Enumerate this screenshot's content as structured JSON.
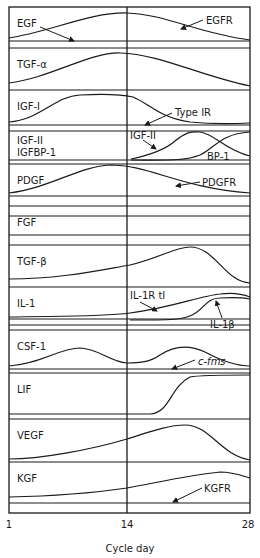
{
  "figure": {
    "box": {
      "x": 9,
      "y": 7,
      "width": 241,
      "height": 506
    },
    "day14_x": 127,
    "line_color": "#1a1a1a",
    "axis": {
      "title": "Cycle day",
      "ticks": [
        {
          "label": "1",
          "x": 9
        },
        {
          "label": "14",
          "x": 127
        },
        {
          "label": "28",
          "x": 248
        }
      ]
    },
    "rows": [
      {
        "id": "egf",
        "label": "EGF",
        "top": 7,
        "bottom": 48,
        "inner_lines": [
          41
        ]
      },
      {
        "id": "tgf-alpha",
        "label": "TGF-α",
        "top": 48,
        "bottom": 90,
        "inner_lines": []
      },
      {
        "id": "igf-i",
        "label": "IGF-I",
        "top": 90,
        "bottom": 131,
        "inner_lines": [
          125
        ]
      },
      {
        "id": "igf-ii",
        "label": "IGF-II",
        "label2": "IGFBP-1",
        "top": 131,
        "bottom": 164,
        "inner_lines": [
          160
        ]
      },
      {
        "id": "pdgf",
        "label": "PDGF",
        "top": 164,
        "bottom": 206,
        "inner_lines": [
          196
        ]
      },
      {
        "id": "fgf",
        "label": "FGF",
        "top": 206,
        "bottom": 245,
        "inner_lines": [
          216,
          235
        ]
      },
      {
        "id": "tgf-beta",
        "label": "TGF-β",
        "top": 245,
        "bottom": 287,
        "inner_lines": []
      },
      {
        "id": "il-1",
        "label": "IL-1",
        "top": 287,
        "bottom": 330,
        "inner_lines": [
          319,
          325
        ]
      },
      {
        "id": "csf-1",
        "label": "CSF-1",
        "top": 330,
        "bottom": 373,
        "inner_lines": [
          369
        ]
      },
      {
        "id": "lif",
        "label": "LIF",
        "top": 373,
        "bottom": 419,
        "inner_lines": []
      },
      {
        "id": "vegf",
        "label": "VEGF",
        "top": 419,
        "bottom": 462,
        "inner_lines": []
      },
      {
        "id": "kgf",
        "label": "KGF",
        "top": 462,
        "bottom": 513,
        "inner_lines": [
          503
        ]
      }
    ],
    "curves": [
      {
        "name": "egf-curve",
        "d": "M9,38 C50,32 90,12 127,13 C165,14 200,34 250,40"
      },
      {
        "name": "tgf-alpha-curve",
        "d": "M9,83 C50,78 90,52 120,53 C160,54 200,76 250,86"
      },
      {
        "name": "igf-i-curve",
        "d": "M9,122 C40,120 55,96 80,95 C100,94 120,94 133,97 C150,104 160,118 190,122 C210,124 230,124 250,123"
      },
      {
        "name": "igf-ii-curve",
        "d": "M131,159 C150,155 165,150 175,141 C185,133 190,131 200,132 C215,134 225,150 250,156"
      },
      {
        "name": "igfbp-1-curve",
        "d": "M131,160 C170,160 185,161 200,155 C215,148 220,134 250,132"
      },
      {
        "name": "pdgf-curve",
        "d": "M9,193 C50,188 80,166 110,165 C150,165 180,188 250,193"
      },
      {
        "name": "tgf-beta-curve",
        "d": "M9,279 C60,279 100,270 130,265 C160,258 175,247 190,247 C215,247 225,282 250,283"
      },
      {
        "name": "il-1r-curve",
        "d": "M9,317 C60,316 100,317 130,313 C170,308 200,296 220,294 C235,292 245,295 250,297"
      },
      {
        "name": "il-1b-curve",
        "d": "M130,320 C170,320 180,320 190,316 C205,310 205,298 220,298 C235,297 245,298 250,299"
      },
      {
        "name": "csf-1-curve",
        "d": "M9,366 C40,364 60,348 80,348 C100,349 110,362 127,363 C140,363 150,362 160,355 C175,345 190,345 205,352 C220,360 235,366 250,366"
      },
      {
        "name": "lif-curve",
        "d": "M9,414 C60,414 120,414 150,414 C170,413 170,387 190,377 C200,375 230,375 250,375"
      },
      {
        "name": "vegf-curve",
        "d": "M9,459 C40,459 90,450 127,439 C155,430 170,425 185,425 C210,425 220,455 250,460"
      },
      {
        "name": "kgf-curve",
        "d": "M9,497 C60,496 100,492 127,488 C160,482 190,475 220,472 C235,472 245,477 250,478"
      }
    ],
    "annotations": [
      {
        "name": "egfr-label",
        "text": "EGFR",
        "x": 206,
        "y": 24,
        "italic": false
      },
      {
        "name": "type-ir-label",
        "text": "Type IR",
        "x": 175,
        "y": 116,
        "italic": false
      },
      {
        "name": "igf-ii-annot-label",
        "text": "IGF-II",
        "x": 130,
        "y": 139,
        "italic": false
      },
      {
        "name": "bp-1-label",
        "text": "BP-1",
        "x": 207,
        "y": 160,
        "italic": false
      },
      {
        "name": "pdgfr-label",
        "text": "PDGFR",
        "x": 202,
        "y": 186,
        "italic": false
      },
      {
        "name": "il-1r-tl-label",
        "text": "IL-1R tI",
        "x": 130,
        "y": 299,
        "italic": false
      },
      {
        "name": "il-1b-label",
        "text": "IL-1β",
        "x": 210,
        "y": 328,
        "italic": false
      },
      {
        "name": "c-fms-label",
        "text": "c-fms",
        "x": 198,
        "y": 365,
        "italic": true
      },
      {
        "name": "kgfr-label",
        "text": "KGFR",
        "x": 204,
        "y": 492,
        "italic": false
      }
    ],
    "arrows": [
      {
        "name": "egf-arrow",
        "x1": 40,
        "y1": 27,
        "x2": 74,
        "y2": 41
      },
      {
        "name": "egfr-arrow",
        "x1": 203,
        "y1": 20,
        "x2": 181,
        "y2": 29
      },
      {
        "name": "type-ir-arrow",
        "x1": 172,
        "y1": 113,
        "x2": 145,
        "y2": 125
      },
      {
        "name": "igf-ii-arrow",
        "x1": 143,
        "y1": 140,
        "x2": 156,
        "y2": 149
      },
      {
        "name": "pdgfr-arrow",
        "x1": 200,
        "y1": 182,
        "x2": 176,
        "y2": 186
      },
      {
        "name": "il-1r-tl-arrow",
        "x1": 140,
        "y1": 302,
        "x2": 157,
        "y2": 311
      },
      {
        "name": "il-1b-arrow",
        "x1": 222,
        "y1": 318,
        "x2": 216,
        "y2": 301
      },
      {
        "name": "c-fms-arrow",
        "x1": 195,
        "y1": 360,
        "x2": 172,
        "y2": 369
      },
      {
        "name": "kgfr-arrow",
        "x1": 202,
        "y1": 488,
        "x2": 173,
        "y2": 502
      }
    ]
  }
}
